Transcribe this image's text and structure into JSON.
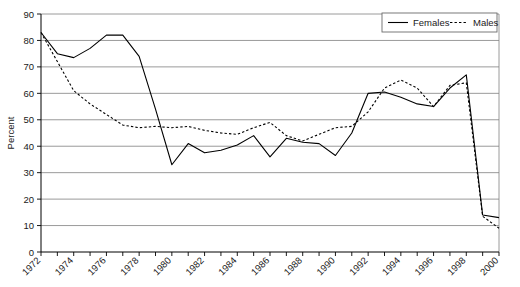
{
  "chart_data": {
    "type": "line",
    "title": "",
    "xlabel": "",
    "ylabel": "Percent",
    "ylim": [
      0,
      90
    ],
    "ytick_step": 10,
    "yticks": [
      0,
      10,
      20,
      30,
      40,
      50,
      60,
      70,
      80,
      90
    ],
    "xlim": [
      1972,
      2000
    ],
    "xticks": [
      1972,
      1974,
      1976,
      1978,
      1980,
      1982,
      1984,
      1986,
      1988,
      1990,
      1992,
      1994,
      1996,
      1998,
      2000
    ],
    "xtick_labels": [
      "1972",
      "1974",
      "1976",
      "1978",
      "1980",
      "1982",
      "1984",
      "1986",
      "1988",
      "1990",
      "1992",
      "1994",
      "1996",
      "1998",
      "2000"
    ],
    "xtick_rotation": 45,
    "grid": "horizontal",
    "legend_position": "top-right",
    "x": [
      1972,
      1973,
      1974,
      1975,
      1976,
      1977,
      1978,
      1979,
      1980,
      1981,
      1982,
      1983,
      1984,
      1985,
      1986,
      1987,
      1988,
      1989,
      1990,
      1991,
      1992,
      1993,
      1994,
      1995,
      1996,
      1997,
      1998,
      1999,
      2000
    ],
    "series": [
      {
        "name": "Females",
        "style": "solid",
        "color": "#000000",
        "values": [
          83,
          75,
          73.5,
          77,
          82,
          82,
          74,
          54,
          33,
          41,
          37.5,
          38.5,
          40.5,
          44,
          36,
          43,
          41.5,
          41,
          36.5,
          45,
          60,
          60.5,
          58.5,
          56,
          55,
          62,
          67,
          14,
          13
        ]
      },
      {
        "name": "Males",
        "style": "dashed",
        "color": "#000000",
        "values": [
          83,
          72,
          61,
          56,
          52,
          48,
          47,
          47.5,
          47,
          47.5,
          46,
          45,
          44.5,
          47,
          49,
          44,
          42,
          44.5,
          47,
          47.5,
          53,
          62,
          65,
          62,
          55,
          63,
          64,
          13.5,
          9
        ]
      }
    ]
  },
  "legend": {
    "entries": [
      {
        "label": "Females",
        "style": "solid"
      },
      {
        "label": "Males",
        "style": "dashed"
      }
    ]
  },
  "axes": {
    "y_title": "Percent"
  }
}
